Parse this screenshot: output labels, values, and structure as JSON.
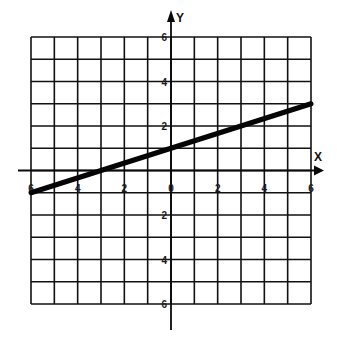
{
  "chart_data": {
    "type": "line",
    "title": "",
    "xlabel": "X",
    "ylabel": "Y",
    "xlim": [
      -6,
      6
    ],
    "ylim": [
      -6,
      6
    ],
    "grid": true,
    "grid_step": 1,
    "x_ticks": [
      -6,
      -4,
      -2,
      0,
      2,
      4,
      6
    ],
    "x_tick_labels": [
      "6",
      "4",
      "2",
      "0",
      "2",
      "4",
      "6"
    ],
    "y_ticks": [
      6,
      4,
      2,
      -2,
      -4,
      -6
    ],
    "y_tick_labels": [
      "6",
      "4",
      "2",
      "2",
      "4",
      "6"
    ],
    "series": [
      {
        "name": "y = x/3 + 1",
        "x": [
          -6,
          6
        ],
        "y": [
          -1,
          3
        ],
        "slope": 0.3333,
        "intercept": 1
      }
    ],
    "legend": null
  },
  "layout": {
    "grid_left": 31,
    "grid_right": 311,
    "grid_top": 37,
    "grid_bottom": 304,
    "y_axis_top": 10,
    "y_axis_bottom": 330,
    "x_axis_left": 18,
    "x_axis_right": 324
  },
  "colors": {
    "ink": "#0a0a0a",
    "paper": "#ffffff"
  }
}
